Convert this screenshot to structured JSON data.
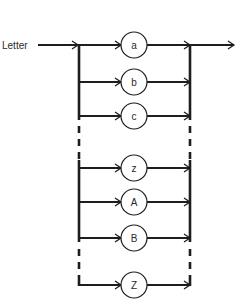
{
  "diagram": {
    "type": "syntax-diagram",
    "entry_label": "Letter",
    "nodes": [
      {
        "label": "a",
        "y": 45
      },
      {
        "label": "b",
        "y": 82
      },
      {
        "label": "c",
        "y": 116
      },
      {
        "label": "z",
        "y": 168
      },
      {
        "label": "A",
        "y": 202
      },
      {
        "label": "B",
        "y": 238
      },
      {
        "label": "Z",
        "y": 285
      }
    ],
    "ellipsis_gaps": [
      {
        "between": [
          "c",
          "z"
        ]
      },
      {
        "between": [
          "B",
          "Z"
        ]
      }
    ],
    "colors": {
      "line": "#1e1e1e",
      "text": "#2a2a2a",
      "background": "#ffffff"
    }
  }
}
